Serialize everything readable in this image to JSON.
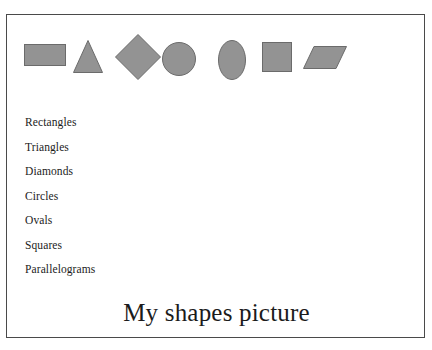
{
  "document": {
    "title": "My shapes picture",
    "background_color": "#ffffff",
    "frame_border_color": "#4a4a4a"
  },
  "shapes": {
    "fill_color": "#939393",
    "stroke_color": "#6b6b6b",
    "items": [
      {
        "name": "rectangle-shape",
        "label": "Rectangle"
      },
      {
        "name": "triangle-shape",
        "label": "Triangle"
      },
      {
        "name": "diamond-shape",
        "label": "Diamond"
      },
      {
        "name": "circle-shape",
        "label": "Circle"
      },
      {
        "name": "oval-shape",
        "label": "Oval"
      },
      {
        "name": "square-shape",
        "label": "Square"
      },
      {
        "name": "parallelogram-shape",
        "label": "Parallelogram"
      }
    ]
  },
  "shape_list": {
    "items": [
      "Rectangles",
      "Triangles",
      "Diamonds",
      "Circles",
      "Ovals",
      "Squares",
      "Parallelograms"
    ]
  },
  "caption": {
    "text": "My shapes picture"
  }
}
